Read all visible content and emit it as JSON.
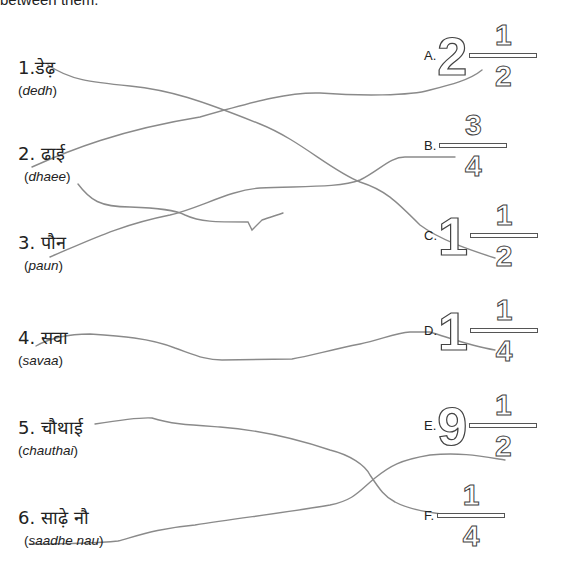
{
  "header": {
    "text": "between them."
  },
  "left_items": [
    {
      "number": "1.",
      "hindi": "डेढ़",
      "translit": "dedh"
    },
    {
      "number": "2.",
      "hindi": "ढाई",
      "translit": "dhaee"
    },
    {
      "number": "3.",
      "hindi": "पौन",
      "translit": "paun"
    },
    {
      "number": "4.",
      "hindi": "सवा",
      "translit": "savaa"
    },
    {
      "number": "5.",
      "hindi": "चौथाई",
      "translit": "chauthai"
    },
    {
      "number": "6.",
      "hindi": "साढ़े नौ",
      "translit": "saadhe nau"
    }
  ],
  "right_items": [
    {
      "letter": "A.",
      "whole": "2",
      "numerator": "1",
      "denominator": "2"
    },
    {
      "letter": "B.",
      "whole": "",
      "numerator": "3",
      "denominator": "4"
    },
    {
      "letter": "C.",
      "whole": "1",
      "numerator": "1",
      "denominator": "2"
    },
    {
      "letter": "D.",
      "whole": "1",
      "numerator": "1",
      "denominator": "4"
    },
    {
      "letter": "E.",
      "whole": "9",
      "numerator": "1",
      "denominator": "2"
    },
    {
      "letter": "F.",
      "whole": "",
      "numerator": "1",
      "denominator": "4"
    }
  ],
  "matches": [
    {
      "from": "1",
      "to": "C"
    },
    {
      "from": "2",
      "to": "A"
    },
    {
      "from": "3",
      "to": "B"
    },
    {
      "from": "4",
      "to": "D"
    },
    {
      "from": "5",
      "to": "F"
    },
    {
      "from": "6",
      "to": "E"
    }
  ],
  "colors": {
    "line": "#8a8a8a",
    "outline": "#444444"
  }
}
